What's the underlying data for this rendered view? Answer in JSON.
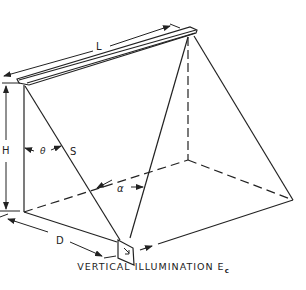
{
  "figure": {
    "type": "technical-diagram",
    "caption": "VERTICAL ILLUMINATION E",
    "caption_subscript": "c",
    "labels": {
      "length": "L",
      "height": "H",
      "angle_theta": "θ",
      "distance_s": "S",
      "angle_alpha": "α",
      "distance_d": "D"
    },
    "colors": {
      "line": "#222222",
      "background": "#ffffff"
    }
  }
}
